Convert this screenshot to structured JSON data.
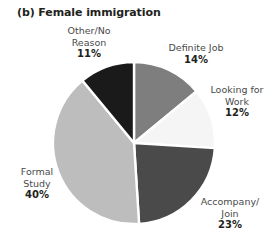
{
  "figure": {
    "title": "(b) Female immigration"
  },
  "chart_data": {
    "type": "pie",
    "title": "(b) Female immigration",
    "xlabel": "",
    "ylabel": "",
    "legend": "none",
    "grid": false,
    "units": "percent",
    "start_angle_deg": 0,
    "direction": "clockwise",
    "categories": [
      "Definite Job",
      "Looking for Work",
      "Accompany/Join",
      "Formal Study",
      "Other/No Reason"
    ],
    "values": [
      14,
      12,
      23,
      40,
      11
    ],
    "slices": [
      {
        "name": "Definite Job",
        "label_line1": "Definite Job",
        "label_line2": "",
        "value": 14,
        "pct_text": "14%",
        "color": "#7e7e7e"
      },
      {
        "name": "Looking for Work",
        "label_line1": "Looking for",
        "label_line2": "Work",
        "value": 12,
        "pct_text": "12%",
        "color": "#f5f5f5"
      },
      {
        "name": "Accompany/Join",
        "label_line1": "Accompany/",
        "label_line2": "Join",
        "value": 23,
        "pct_text": "23%",
        "color": "#4a4a4a"
      },
      {
        "name": "Formal Study",
        "label_line1": "Formal",
        "label_line2": "Study",
        "value": 40,
        "pct_text": "40%",
        "color": "#bdbdbd"
      },
      {
        "name": "Other/No Reason",
        "label_line1": "Other/No",
        "label_line2": "Reason",
        "value": 11,
        "pct_text": "11%",
        "color": "#1a1a1a"
      }
    ],
    "colors": {
      "definite_job": "#7e7e7e",
      "looking_for_work": "#f5f5f5",
      "accompany_join": "#4a4a4a",
      "formal_study": "#bdbdbd",
      "other_no_reason": "#1a1a1a",
      "slice_divider": "#ffffff",
      "background": "#ffffff",
      "label_text": "#4a4a4a",
      "value_text": "#231f20"
    },
    "geometry": {
      "center_x": 134,
      "center_y": 143,
      "radius": 81
    }
  }
}
